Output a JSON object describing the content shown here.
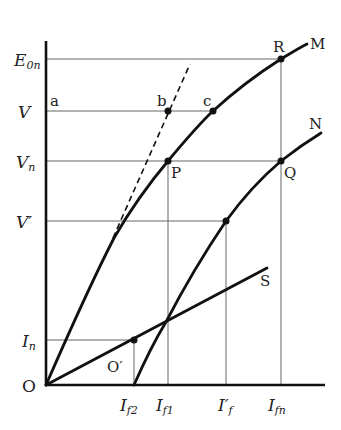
{
  "diagram": {
    "type": "generator characteristic curves (open-circuit, load, short-circuit)",
    "axes": {
      "origin_label": "O",
      "y_labels": [
        {
          "id": "E0n",
          "main": "E",
          "sub": "0n",
          "y": 59
        },
        {
          "id": "V",
          "main": "V",
          "sub": "",
          "y": 111
        },
        {
          "id": "Vn",
          "main": "V",
          "sub": "n",
          "y": 161
        },
        {
          "id": "Vprime",
          "main": "V′",
          "sub": "",
          "y": 221
        },
        {
          "id": "In",
          "main": "I",
          "sub": "n",
          "y": 340
        }
      ],
      "x_labels": [
        {
          "id": "If2",
          "main": "I",
          "sub": "f2",
          "x": 134
        },
        {
          "id": "If1",
          "main": "I",
          "sub": "f1",
          "x": 168
        },
        {
          "id": "Ifprime",
          "main": "I′",
          "sub": "f",
          "x": 226
        },
        {
          "id": "Ifn",
          "main": "I",
          "sub": "fn",
          "x": 281
        }
      ]
    },
    "curves": [
      {
        "id": "M",
        "label": "M",
        "description": "no-load characteristic"
      },
      {
        "id": "N",
        "label": "N",
        "description": "load characteristic"
      },
      {
        "id": "S",
        "label": "S",
        "description": "short-circuit characteristic"
      },
      {
        "id": "air-gap",
        "label": "",
        "description": "dashed air-gap line"
      }
    ],
    "points": [
      {
        "label": "a",
        "x": 46,
        "y": 111
      },
      {
        "label": "b",
        "x": 168,
        "y": 111
      },
      {
        "label": "c",
        "x": 213,
        "y": 111
      },
      {
        "label": "R",
        "x": 281,
        "y": 59
      },
      {
        "label": "P",
        "x": 168,
        "y": 161
      },
      {
        "label": "Q",
        "x": 281,
        "y": 161
      },
      {
        "label": "O′",
        "x": 134,
        "y": 340
      }
    ],
    "colors": {
      "line": "#111111",
      "grid": "#666666",
      "text": "#222222",
      "background": "#ffffff"
    }
  },
  "text": {
    "O": "O",
    "M": "M",
    "N": "N",
    "S": "S",
    "R": "R",
    "P": "P",
    "Q": "Q",
    "a": "a",
    "b": "b",
    "c": "c",
    "Oprime": "O′",
    "E": "E",
    "E_sub": "0n",
    "V": "V",
    "Vn": "V",
    "Vn_sub": "n",
    "Vprime": "V′",
    "In": "I",
    "In_sub": "n",
    "If2": "I",
    "If2_sub": "f2",
    "If1": "I",
    "If1_sub": "f1",
    "Ifp": "I′",
    "Ifp_sub": "f",
    "Ifn": "I",
    "Ifn_sub": "fn"
  }
}
